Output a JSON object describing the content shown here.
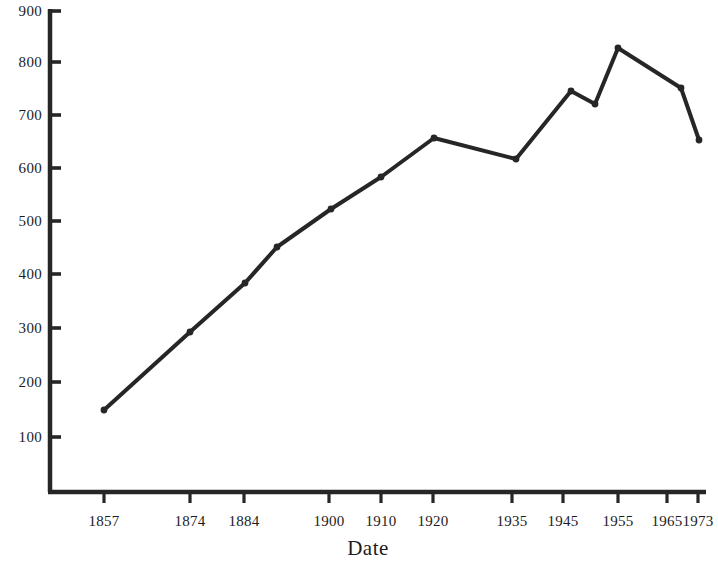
{
  "chart_data": {
    "type": "line",
    "title": "",
    "xlabel": "Date",
    "ylabel": "",
    "categories": [
      "1857",
      "1874",
      "1884",
      "1890",
      "1900",
      "1910",
      "1920",
      "1935",
      "1945",
      "1950",
      "1955",
      "1965",
      "1973"
    ],
    "x": [
      1857,
      1874,
      1884,
      1890,
      1900,
      1910,
      1920,
      1935,
      1945,
      1950,
      1955,
      1965,
      1973
    ],
    "values": [
      155,
      295,
      385,
      453,
      525,
      587,
      657,
      620,
      745,
      722,
      828,
      752,
      652
    ],
    "series": [
      {
        "name": "",
        "values": [
          155,
          295,
          385,
          453,
          525,
          587,
          657,
          620,
          745,
          722,
          828,
          752,
          652
        ]
      }
    ],
    "x_tick_labels": [
      "1857",
      "1874",
      "1884",
      "1900",
      "1910",
      "1920",
      "1935",
      "1945",
      "1955",
      "1965",
      "1973"
    ],
    "x_tick_px": [
      104,
      190,
      244,
      329,
      381,
      433,
      512,
      563,
      618,
      667,
      698
    ],
    "y_tick_labels": [
      "900",
      "800",
      "700",
      "600",
      "500",
      "400",
      "300",
      "200",
      "100"
    ],
    "y_tick_values": [
      900,
      800,
      700,
      600,
      500,
      400,
      300,
      200,
      100
    ],
    "ylim": [
      0,
      900
    ],
    "xlim": [
      1850,
      1975
    ],
    "grid": false,
    "legend": false,
    "legend_position": "none",
    "marker": "circle",
    "line_color": "#262626",
    "axis_color": "#262626",
    "background_color": "#ffffff",
    "point_px": [
      {
        "x": 104,
        "y": 410,
        "label": "1857",
        "value": 155
      },
      {
        "x": 190,
        "y": 332,
        "label": "1874",
        "value": 295
      },
      {
        "x": 245,
        "y": 283,
        "label": "1884",
        "value": 385
      },
      {
        "x": 277,
        "y": 247,
        "label": "1890",
        "value": 453
      },
      {
        "x": 331,
        "y": 209,
        "label": "1900",
        "value": 525
      },
      {
        "x": 381,
        "y": 177,
        "label": "1910",
        "value": 587
      },
      {
        "x": 434,
        "y": 138,
        "label": "1920",
        "value": 657
      },
      {
        "x": 516,
        "y": 159,
        "label": "1935",
        "value": 620
      },
      {
        "x": 571,
        "y": 91,
        "label": "1945",
        "value": 745
      },
      {
        "x": 595,
        "y": 104,
        "label": "1950",
        "value": 722
      },
      {
        "x": 618,
        "y": 48,
        "label": "1955",
        "value": 828
      },
      {
        "x": 681,
        "y": 88,
        "label": "1965",
        "value": 752
      },
      {
        "x": 699,
        "y": 140,
        "label": "1973",
        "value": 652
      }
    ]
  },
  "axes": {
    "x_title": "Date",
    "y_ticks": [
      {
        "label": "900",
        "px_y": 11
      },
      {
        "label": "800",
        "px_y": 62
      },
      {
        "label": "700",
        "px_y": 115
      },
      {
        "label": "600",
        "px_y": 168
      },
      {
        "label": "500",
        "px_y": 221
      },
      {
        "label": "400",
        "px_y": 274
      },
      {
        "label": "300",
        "px_y": 328
      },
      {
        "label": "200",
        "px_y": 382
      },
      {
        "label": "100",
        "px_y": 437
      }
    ],
    "x_ticks": [
      {
        "label": "1857",
        "px_x": 104
      },
      {
        "label": "1874",
        "px_x": 190
      },
      {
        "label": "1884",
        "px_x": 244
      },
      {
        "label": "1900",
        "px_x": 329
      },
      {
        "label": "1910",
        "px_x": 381
      },
      {
        "label": "1920",
        "px_x": 433
      },
      {
        "label": "1935",
        "px_x": 512
      },
      {
        "label": "1945",
        "px_x": 563
      },
      {
        "label": "1955",
        "px_x": 618
      },
      {
        "label": "1965",
        "px_x": 667
      },
      {
        "label": "1973",
        "px_x": 698
      }
    ]
  }
}
